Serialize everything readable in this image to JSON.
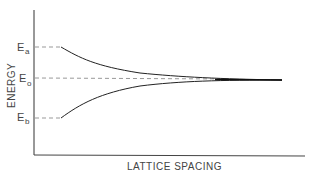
{
  "diagram": {
    "type": "energy-level splitting vs lattice spacing",
    "axes": {
      "y_label": "ENERGY",
      "x_label": "LATTICE SPACING"
    },
    "levels": [
      {
        "id": "Ea",
        "symbol": "E",
        "subscript": "a"
      },
      {
        "id": "E0",
        "symbol": "E",
        "subscript": "o"
      },
      {
        "id": "Eb",
        "symbol": "E",
        "subscript": "b"
      }
    ],
    "colors": {
      "line": "#222222",
      "dashed": "#999999",
      "text": "#444444"
    }
  }
}
